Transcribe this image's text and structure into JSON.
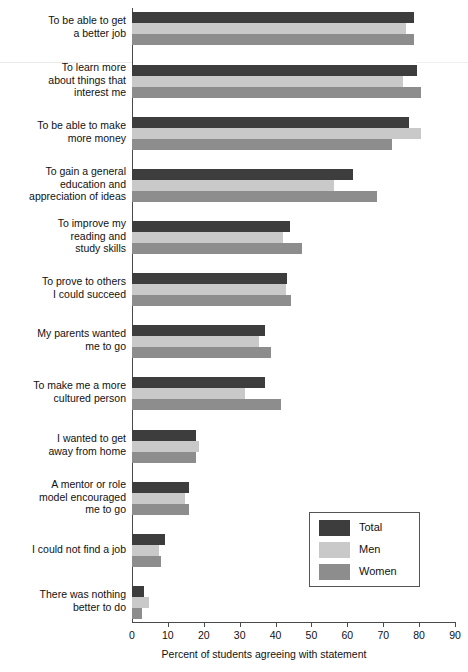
{
  "chart_data": {
    "type": "bar",
    "orientation": "horizontal",
    "title": "",
    "xlabel": "Percent of students agreeing with statement",
    "ylabel": "",
    "xlim": [
      0,
      90
    ],
    "xticks": [
      0,
      10,
      20,
      30,
      40,
      50,
      60,
      70,
      80,
      90
    ],
    "grid": false,
    "legend_position": "center-right",
    "categories": [
      "To be able to get a better job",
      "To learn more about things that interest me",
      "To be able to make more money",
      "To gain a general education and appreciation of ideas",
      "To improve my reading and study skills",
      "To prove to others I could succeed",
      "My parents wanted me to go",
      "To make me a more cultured person",
      "I wanted to get away from home",
      "A mentor or role model encouraged me to go",
      "I could not find a job",
      "There was nothing better to do"
    ],
    "category_lines": [
      [
        "To be able to get",
        "a better job"
      ],
      [
        "To learn more",
        "about things that",
        "interest me"
      ],
      [
        "To be able to make",
        "more money"
      ],
      [
        "To gain a general",
        "education and",
        "appreciation of ideas"
      ],
      [
        "To improve my",
        "reading and",
        "study skills"
      ],
      [
        "To prove to others",
        "I could succeed"
      ],
      [
        "My parents wanted",
        "me to go"
      ],
      [
        "To make me a more",
        "cultured person"
      ],
      [
        "I wanted to get",
        "away from home"
      ],
      [
        "A mentor or role",
        "model encouraged",
        "me to go"
      ],
      [
        "I could not find a job"
      ],
      [
        "There was nothing",
        "better to do"
      ]
    ],
    "series": [
      {
        "name": "Total",
        "color": "#3d3d3d",
        "values": [
          78.5,
          79.4,
          77.2,
          61.6,
          43.9,
          43.1,
          37.0,
          37.0,
          17.7,
          16.0,
          9.1,
          3.3
        ]
      },
      {
        "name": "Men",
        "color": "#c9c9c9",
        "values": [
          76.4,
          75.5,
          80.5,
          56.2,
          42.2,
          42.8,
          35.3,
          31.4,
          18.8,
          14.9,
          7.6,
          4.6
        ]
      },
      {
        "name": "Women",
        "color": "#8d8d8d",
        "values": [
          78.5,
          80.5,
          72.5,
          68.3,
          47.4,
          44.4,
          38.8,
          41.4,
          17.7,
          16.0,
          8.2,
          2.8
        ]
      }
    ]
  },
  "legend": {
    "entries": [
      {
        "label": "Total",
        "color": "#3d3d3d"
      },
      {
        "label": "Men",
        "color": "#c9c9c9"
      },
      {
        "label": "Women",
        "color": "#8d8d8d"
      }
    ]
  },
  "axis": {
    "x_title": "Percent of students agreeing with statement",
    "tick_labels": [
      "0",
      "10",
      "20",
      "30",
      "40",
      "50",
      "60",
      "70",
      "80",
      "90"
    ]
  }
}
